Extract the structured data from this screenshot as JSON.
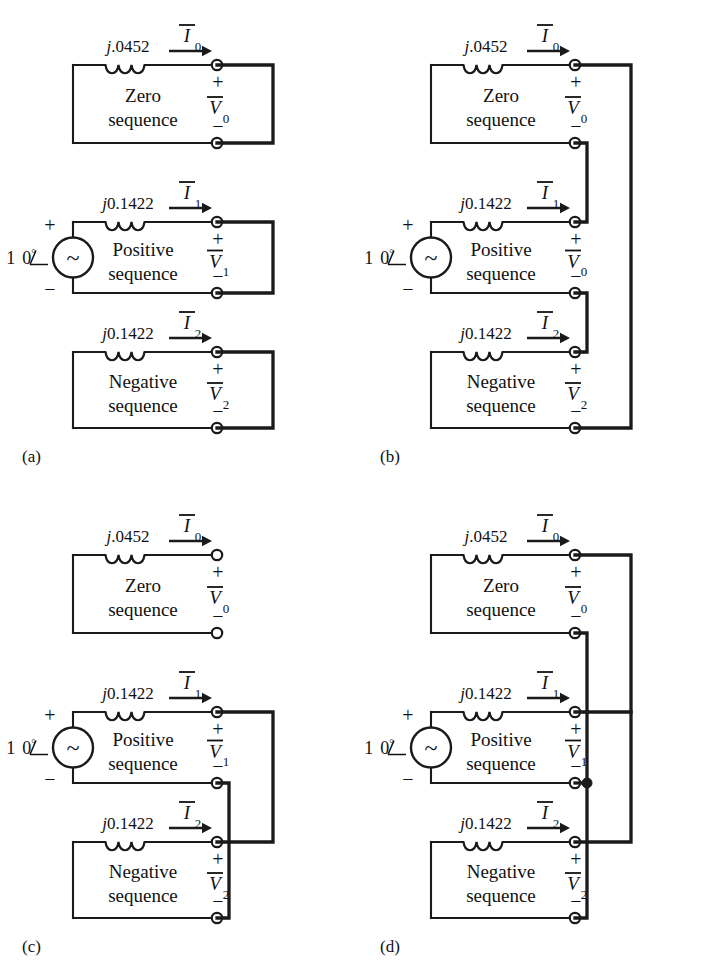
{
  "figure": {
    "panels": [
      {
        "id": "a",
        "label": "(a)",
        "connection": "none",
        "networks": [
          {
            "name": "zero",
            "block_line1": "Zero",
            "block_line2": "sequence",
            "impedance_j": "j",
            "impedance_value": ".0452",
            "current_symbol": "I",
            "current_subscript": "0",
            "voltage_symbol": "V",
            "voltage_subscript": "0",
            "plus_sign": "+",
            "minus_sign": "−",
            "has_source": false
          },
          {
            "name": "positive",
            "block_line1": "Positive",
            "block_line2": "sequence",
            "impedance_j": "j",
            "impedance_value": "0.1422",
            "current_symbol": "I",
            "current_subscript": "1",
            "voltage_symbol": "V",
            "voltage_subscript": "1",
            "plus_sign": "+",
            "minus_sign": "−",
            "has_source": true,
            "source_label_mag": "1",
            "source_label_angle": "0",
            "source_label_deg": "°",
            "source_glyph": "~",
            "source_plus": "+",
            "source_minus": "−"
          },
          {
            "name": "negative",
            "block_line1": "Negative",
            "block_line2": "sequence",
            "impedance_j": "j",
            "impedance_value": "0.1422",
            "current_symbol": "I",
            "current_subscript": "2",
            "voltage_symbol": "V",
            "voltage_subscript": "2",
            "plus_sign": "+",
            "minus_sign": "−",
            "has_source": false
          }
        ]
      },
      {
        "id": "b",
        "label": "(b)",
        "connection": "series",
        "networks": [
          {
            "name": "zero",
            "block_line1": "Zero",
            "block_line2": "sequence",
            "impedance_j": "j",
            "impedance_value": ".0452",
            "current_symbol": "I",
            "current_subscript": "0",
            "voltage_symbol": "V",
            "voltage_subscript": "0",
            "plus_sign": "+",
            "minus_sign": "−",
            "has_source": false
          },
          {
            "name": "positive",
            "block_line1": "Positive",
            "block_line2": "sequence",
            "impedance_j": "j",
            "impedance_value": "0.1422",
            "current_symbol": "I",
            "current_subscript": "1",
            "voltage_symbol": "V",
            "voltage_subscript": "0",
            "plus_sign": "+",
            "minus_sign": "−",
            "has_source": true,
            "source_label_mag": "1",
            "source_label_angle": "0",
            "source_label_deg": "°",
            "source_glyph": "~",
            "source_plus": "+",
            "source_minus": "−"
          },
          {
            "name": "negative",
            "block_line1": "Negative",
            "block_line2": "sequence",
            "impedance_j": "j",
            "impedance_value": "0.1422",
            "current_symbol": "I",
            "current_subscript": "2",
            "voltage_symbol": "V",
            "voltage_subscript": "2",
            "plus_sign": "+",
            "minus_sign": "−",
            "has_source": false
          }
        ]
      },
      {
        "id": "c",
        "label": "(c)",
        "connection": "positive-negative-parallel",
        "networks": [
          {
            "name": "zero",
            "block_line1": "Zero",
            "block_line2": "sequence",
            "impedance_j": "j",
            "impedance_value": ".0452",
            "current_symbol": "I",
            "current_subscript": "0",
            "voltage_symbol": "V",
            "voltage_subscript": "0",
            "plus_sign": "+",
            "minus_sign": "−",
            "has_source": false
          },
          {
            "name": "positive",
            "block_line1": "Positive",
            "block_line2": "sequence",
            "impedance_j": "j",
            "impedance_value": "0.1422",
            "current_symbol": "I",
            "current_subscript": "1",
            "voltage_symbol": "V",
            "voltage_subscript": "1",
            "plus_sign": "+",
            "minus_sign": "−",
            "has_source": true,
            "source_label_mag": "1",
            "source_label_angle": "0",
            "source_label_deg": "°",
            "source_glyph": "~",
            "source_plus": "+",
            "source_minus": "−"
          },
          {
            "name": "negative",
            "block_line1": "Negative",
            "block_line2": "sequence",
            "impedance_j": "j",
            "impedance_value": "0.1422",
            "current_symbol": "I",
            "current_subscript": "2",
            "voltage_symbol": "V",
            "voltage_subscript": "2",
            "plus_sign": "+",
            "minus_sign": "−",
            "has_source": false
          }
        ]
      },
      {
        "id": "d",
        "label": "(d)",
        "connection": "all-parallel",
        "networks": [
          {
            "name": "zero",
            "block_line1": "Zero",
            "block_line2": "sequence",
            "impedance_j": "j",
            "impedance_value": ".0452",
            "current_symbol": "I",
            "current_subscript": "0",
            "voltage_symbol": "V",
            "voltage_subscript": "0",
            "plus_sign": "+",
            "minus_sign": "−",
            "has_source": false
          },
          {
            "name": "positive",
            "block_line1": "Positive",
            "block_line2": "sequence",
            "impedance_j": "j",
            "impedance_value": "0.1422",
            "current_symbol": "I",
            "current_subscript": "1",
            "voltage_symbol": "V",
            "voltage_subscript": "1",
            "plus_sign": "+",
            "minus_sign": "−",
            "has_source": true,
            "source_label_mag": "1",
            "source_label_angle": "0",
            "source_label_deg": "°",
            "source_glyph": "~",
            "source_plus": "+",
            "source_minus": "−"
          },
          {
            "name": "negative",
            "block_line1": "Negative",
            "block_line2": "sequence",
            "impedance_j": "j",
            "impedance_value": "0.1422",
            "current_symbol": "I",
            "current_subscript": "2",
            "voltage_symbol": "V",
            "voltage_subscript": "2",
            "plus_sign": "+",
            "minus_sign": "−",
            "has_source": false
          }
        ]
      }
    ],
    "colors": {
      "ink": "#1a1a1a",
      "paper": "#ffffff"
    }
  }
}
